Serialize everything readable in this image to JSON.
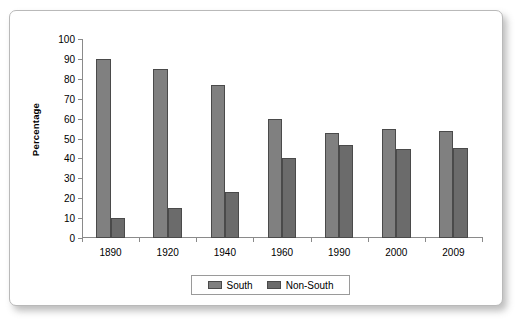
{
  "card": {
    "background": "#ffffff",
    "border_color": "#b9b9b9"
  },
  "chart_data": {
    "type": "bar",
    "title": "",
    "subtitle": "",
    "xlabel": "",
    "ylabel": "Percentage",
    "ylim": [
      0,
      100
    ],
    "ytick_step": 10,
    "yticks": [
      0,
      10,
      20,
      30,
      40,
      50,
      60,
      70,
      80,
      90,
      100
    ],
    "ytick_labels": [
      "0",
      "10",
      "20",
      "30",
      "40",
      "50",
      "60",
      "70",
      "80",
      "90",
      "100"
    ],
    "grid": false,
    "legend_position": "bottom-center",
    "categories": [
      "1890",
      "1920",
      "1940",
      "1960",
      "1990",
      "2000",
      "2009"
    ],
    "series": [
      {
        "name": "South",
        "color": "#808080",
        "values": [
          90,
          85,
          77,
          60,
          53,
          55,
          54
        ]
      },
      {
        "name": "Non-South",
        "color": "#6b6b6b",
        "values": [
          10,
          15,
          23,
          40,
          46.5,
          44.5,
          45
        ]
      }
    ]
  }
}
